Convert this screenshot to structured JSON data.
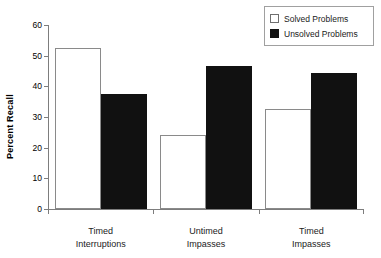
{
  "chart_data": {
    "type": "bar",
    "title": "",
    "xlabel": "",
    "ylabel": "Percent Recall",
    "ylim": [
      0,
      60
    ],
    "ytick_values": [
      0,
      10,
      20,
      30,
      40,
      50,
      60
    ],
    "ytick_labels": [
      "0",
      "10",
      "20",
      "30",
      "40",
      "50",
      "60"
    ],
    "grid": false,
    "legend_position": "top-right",
    "categories": [
      "Timed\nInterruptions",
      "Untimed\nImpasses",
      "Timed\nImpasses"
    ],
    "category_lines": [
      [
        "Timed",
        "Interruptions"
      ],
      [
        "Untimed",
        "Impasses"
      ],
      [
        "Timed",
        "Impasses"
      ]
    ],
    "series": [
      {
        "name": "Solved Problems",
        "color": "#ffffff",
        "edge_color": "#8a8a8a",
        "values": [
          52.5,
          24.0,
          32.5
        ]
      },
      {
        "name": "Unsolved Problems",
        "color": "#111111",
        "edge_color": "#111111",
        "values": [
          37.5,
          46.5,
          44.5
        ]
      }
    ]
  },
  "legend": {
    "items": [
      {
        "label": "Solved Problems",
        "swatch": "white-square-icon"
      },
      {
        "label": "Unsolved Problems",
        "swatch": "black-square-icon"
      }
    ]
  },
  "axis": {
    "y_label": "Percent Recall"
  }
}
